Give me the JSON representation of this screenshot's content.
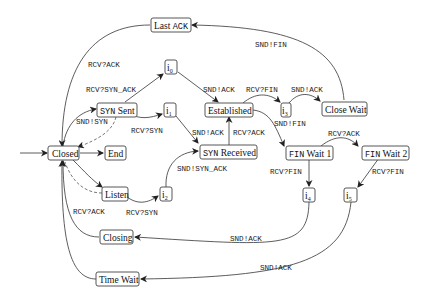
{
  "diagram": {
    "type": "tcp-state-machine",
    "nodes": {
      "closed": "Closed",
      "end": "End",
      "listen": "Listen",
      "syn_sent_mono": "SYN",
      "syn_sent_rest": " Sent",
      "syn_received_mono": "SYN",
      "syn_received_rest": " Received",
      "established": "Established",
      "close_wait": "Close Wait",
      "last_ack_rest": "Last ",
      "last_ack_mono": "ACK",
      "fin_wait1_mono": "FIN",
      "fin_wait1_rest": " Wait 1",
      "fin_wait2_mono": "FIN",
      "fin_wait2_rest": " Wait 2",
      "closing": "Closing",
      "time_wait": "Time Wait",
      "i0": "i",
      "i0_sub": "0",
      "i1": "i",
      "i1_sub": "1",
      "i2": "i",
      "i2_sub": "2",
      "i3": "i",
      "i3_sub": "3",
      "i4": "i",
      "i4_sub": "4",
      "i5": "i",
      "i5_sub": "5"
    },
    "edge_labels": {
      "lastack_closed": "RCV?ACK",
      "closewait_lastack": "SND!FIN",
      "synsent_i0": "RCV?SYN_ACK",
      "i0_established": "SND!ACK",
      "closed_synsent": "SND!SYN",
      "synsent_i1": "RCV?SYN",
      "i1_synreceived": "SND!ACK",
      "synreceived_established": "RCV?ACK",
      "established_i3": "RCV?FIN",
      "i3_closewait": "SND!ACK",
      "established_finwait1": "SND!FIN",
      "finwait1_finwait2": "RCV?ACK",
      "i2_synreceived": "SND!SYN_ACK",
      "listen_i2": "RCV?SYN",
      "finwait1_i4": "RCV?FIN",
      "finwait2_i5": "RCV?FIN",
      "closing_closed": "RCV?ACK",
      "i4_closing": "SND!ACK",
      "i5_timewait": "SND!ACK"
    }
  }
}
